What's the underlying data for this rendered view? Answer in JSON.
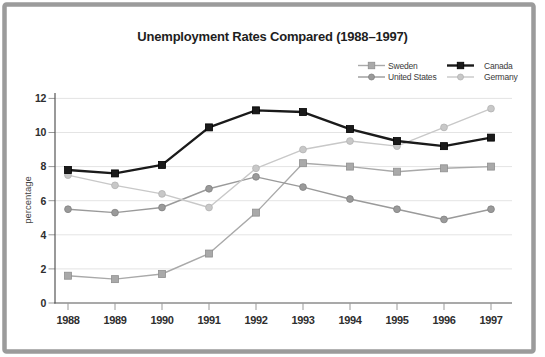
{
  "frame": {
    "border_color": "#9b9b9b",
    "background": "#ffffff"
  },
  "chart_data": {
    "type": "line",
    "title": "Unemployment Rates Compared (1988–1997)",
    "xlabel": "",
    "ylabel": "percentage",
    "x": [
      1988,
      1989,
      1990,
      1991,
      1992,
      1993,
      1994,
      1995,
      1996,
      1997
    ],
    "y_ticks": [
      0,
      2,
      4,
      6,
      8,
      10,
      12
    ],
    "ylim": [
      0,
      12
    ],
    "grid": "horizontal",
    "legend_position": "top-right",
    "legend_columns": [
      [
        "Sweden",
        "United States"
      ],
      [
        "Canada",
        "Germany"
      ]
    ],
    "series": [
      {
        "name": "Sweden",
        "marker": "square",
        "color": "#a9a9a9",
        "edge_color": "#8f8f8f",
        "line_width": 1.4,
        "values": [
          1.6,
          1.4,
          1.7,
          2.9,
          5.3,
          8.2,
          8.0,
          7.7,
          7.9,
          8.0
        ]
      },
      {
        "name": "United States",
        "marker": "circle",
        "color": "#9a9a9a",
        "edge_color": "#818181",
        "line_width": 1.4,
        "values": [
          5.5,
          5.3,
          5.6,
          6.7,
          7.4,
          6.8,
          6.1,
          5.5,
          4.9,
          5.5
        ]
      },
      {
        "name": "Canada",
        "marker": "square",
        "color": "#1a1a1a",
        "edge_color": "#000000",
        "line_width": 2.4,
        "values": [
          7.8,
          7.6,
          8.1,
          10.3,
          11.3,
          11.2,
          10.2,
          9.5,
          9.2,
          9.7
        ]
      },
      {
        "name": "Germany",
        "marker": "circle",
        "color": "#c8c8c8",
        "edge_color": "#b2b2b2",
        "line_width": 1.4,
        "values": [
          7.5,
          6.9,
          6.4,
          5.6,
          7.9,
          9.0,
          9.5,
          9.2,
          10.3,
          11.4
        ]
      }
    ]
  }
}
